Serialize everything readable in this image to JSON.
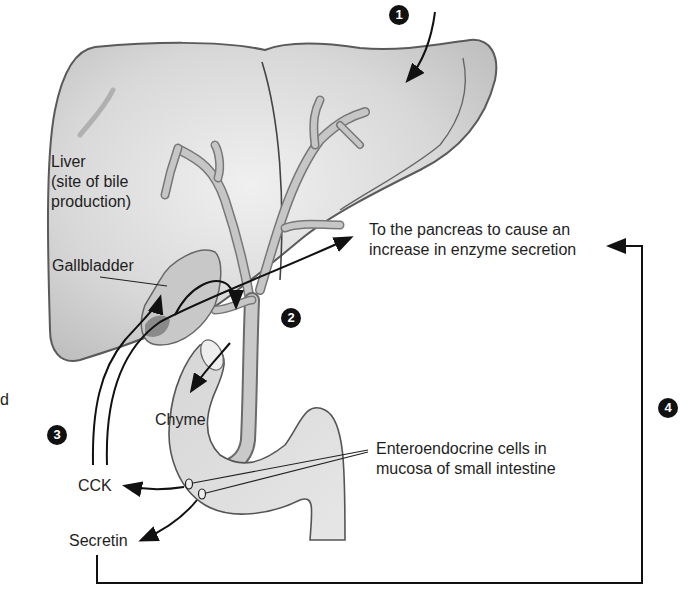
{
  "figure": {
    "type": "anatomical-diagram"
  },
  "labels": {
    "liver_line1": "Liver",
    "liver_line2": "(site of bile",
    "liver_line3": "production)",
    "gallbladder": "Gallbladder",
    "pancreas_line1": "To the pancreas to cause an",
    "pancreas_line2": "increase in enzyme secretion",
    "chyme": "Chyme",
    "entero_line1": "Enteroendocrine cells in",
    "entero_line2": "mucosa of small intestine",
    "cck": "CCK",
    "secretin": "Secretin",
    "cut_fragment": "d"
  },
  "steps": [
    {
      "number": "1"
    },
    {
      "number": "2"
    },
    {
      "number": "3"
    },
    {
      "number": "4"
    }
  ],
  "colors": {
    "organ_fill": "#d9d9d9",
    "organ_stroke": "#5a5a5a",
    "duct_fill": "#c4c4c4",
    "arrow": "#111111",
    "step_badge": "#111111"
  }
}
